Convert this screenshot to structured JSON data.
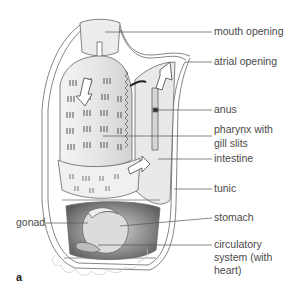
{
  "figure": {
    "panel_letter": "a",
    "labels": {
      "mouth_opening": "mouth opening",
      "atrial_opening": "atrial opening",
      "anus": "anus",
      "pharynx_line1": "pharynx with",
      "pharynx_line2": "gill slits",
      "intestine": "intestine",
      "tunic": "tunic",
      "stomach": "stomach",
      "gonad": "gonad",
      "circulatory_line1": "circulatory",
      "circulatory_line2": "system (with",
      "circulatory_line3": "heart)"
    },
    "colors": {
      "line": "#555555",
      "text": "#4a4a4a",
      "shading_dark": "#6e6e6e",
      "shading_mid": "#b5b5b5",
      "shading_light": "#e4e4e4"
    }
  }
}
